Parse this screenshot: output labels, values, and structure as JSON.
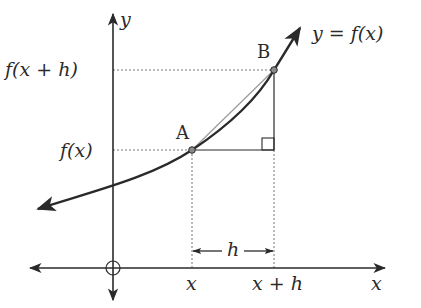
{
  "diagram": {
    "axes": {
      "x_axis_label": "x",
      "y_axis_label": "y",
      "origin_marker": "circle-with-cross"
    },
    "curve": {
      "label": "y =  f(x)",
      "direction": "increasing, concave up, arrows at both ends"
    },
    "points": [
      {
        "id": "A",
        "label": "A",
        "x_label": "x",
        "y_label": "f(x)"
      },
      {
        "id": "B",
        "label": "B",
        "x_label": "x + h",
        "y_label": "f(x + h)"
      }
    ],
    "y_ticks": [
      "f(x + h)",
      "f(x)"
    ],
    "x_ticks": [
      "x",
      "x + h",
      "x"
    ],
    "interval": {
      "label": "h",
      "from": "x",
      "to": "x + h"
    },
    "annotations": {
      "right_angle_marker": "at (x + h, f(x))",
      "secant": "segment AB"
    },
    "colors": {
      "ink": "#2a2a2a",
      "dashed_guides": "#777777",
      "point_fill": "#8a8a8a",
      "background": "#ffffff"
    }
  }
}
